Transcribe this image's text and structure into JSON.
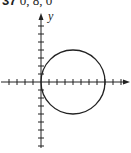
{
  "problem": {
    "number": "37",
    "values": "0, 8, 0"
  },
  "axes": {
    "x_label": "",
    "y_label": "y"
  },
  "diagram": {
    "type": "circle-on-axes",
    "circle": {
      "center": [
        4,
        0
      ],
      "radius": 4
    },
    "tick_spacing_px": 8,
    "origin_px": [
      41,
      82
    ],
    "x_ticks_range": [
      -4,
      9
    ],
    "y_ticks_range": [
      -8,
      8
    ]
  }
}
